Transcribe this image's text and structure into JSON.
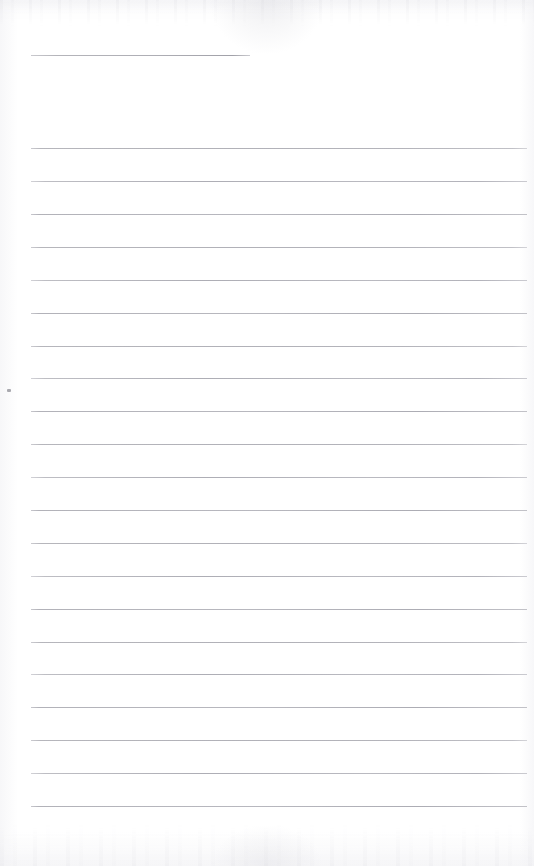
{
  "document": {
    "type": "scanned-blank-lined-paper",
    "title": "",
    "content_text": "",
    "page_width": 534,
    "page_height": 866,
    "background_color": "#fefefe",
    "rule_color": "#b4b4b9",
    "speck_color": "#8e8e96"
  },
  "header_rule": {
    "name": "title-rule",
    "x": 31,
    "y": 55,
    "width": 219,
    "text": ""
  },
  "ruled_lines": [
    {
      "index": 1,
      "y": 148,
      "x": 31,
      "width": 496,
      "text": ""
    },
    {
      "index": 2,
      "y": 181,
      "x": 31,
      "width": 496,
      "text": ""
    },
    {
      "index": 3,
      "y": 214,
      "x": 31,
      "width": 496,
      "text": ""
    },
    {
      "index": 4,
      "y": 247,
      "x": 31,
      "width": 496,
      "text": ""
    },
    {
      "index": 5,
      "y": 280,
      "x": 31,
      "width": 496,
      "text": ""
    },
    {
      "index": 6,
      "y": 313,
      "x": 31,
      "width": 496,
      "text": ""
    },
    {
      "index": 7,
      "y": 346,
      "x": 31,
      "width": 496,
      "text": ""
    },
    {
      "index": 8,
      "y": 378,
      "x": 31,
      "width": 496,
      "text": ""
    },
    {
      "index": 9,
      "y": 411,
      "x": 31,
      "width": 496,
      "text": ""
    },
    {
      "index": 10,
      "y": 444,
      "x": 31,
      "width": 496,
      "text": ""
    },
    {
      "index": 11,
      "y": 477,
      "x": 31,
      "width": 496,
      "text": ""
    },
    {
      "index": 12,
      "y": 510,
      "x": 31,
      "width": 496,
      "text": ""
    },
    {
      "index": 13,
      "y": 543,
      "x": 31,
      "width": 496,
      "text": ""
    },
    {
      "index": 14,
      "y": 576,
      "x": 31,
      "width": 496,
      "text": ""
    },
    {
      "index": 15,
      "y": 609,
      "x": 31,
      "width": 496,
      "text": ""
    },
    {
      "index": 16,
      "y": 642,
      "x": 31,
      "width": 496,
      "text": ""
    },
    {
      "index": 17,
      "y": 674,
      "x": 31,
      "width": 496,
      "text": ""
    },
    {
      "index": 18,
      "y": 707,
      "x": 31,
      "width": 496,
      "text": ""
    },
    {
      "index": 19,
      "y": 740,
      "x": 31,
      "width": 496,
      "text": ""
    },
    {
      "index": 20,
      "y": 773,
      "x": 31,
      "width": 496,
      "text": ""
    },
    {
      "index": 21,
      "y": 806,
      "x": 31,
      "width": 496,
      "text": ""
    }
  ],
  "artifacts": {
    "margin_speck": {
      "x": 7,
      "y": 389,
      "width": 4,
      "height": 3
    },
    "scan_noise_top": {
      "height": 26
    },
    "scan_noise_bottom": {
      "height": 42
    }
  }
}
